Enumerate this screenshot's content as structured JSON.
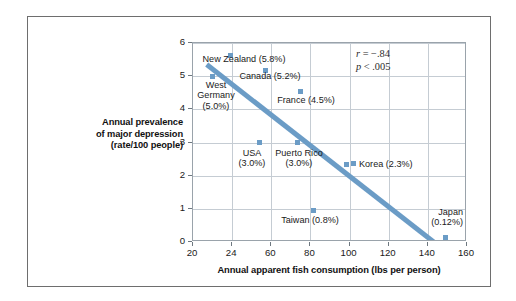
{
  "figure": {
    "border_color": "#6e6e6e",
    "background": "#ffffff"
  },
  "axes": {
    "x_title": "Annual apparent fish consumption (lbs per person)",
    "y_title_lines": [
      "Annual prevalence",
      "of major depression",
      "(rate/100 people)"
    ],
    "x_ticks": [
      "20",
      "24",
      "60",
      "80",
      "100",
      "120",
      "140",
      "160"
    ],
    "y_ticks": [
      "0",
      "1",
      "2",
      "3",
      "4",
      "5",
      "6"
    ]
  },
  "annotation": {
    "r_var": "r",
    "r_text": " = −.84",
    "p_var": "p",
    "p_text": " < .005"
  },
  "style": {
    "marker_color": "#6b9cc6",
    "trendline_color": "#6b9cc6",
    "gridline_color": "#c5ccd3",
    "plot_border_color": "#9aa3ab"
  },
  "chart_data": {
    "type": "scatter",
    "title": "",
    "xlabel": "Annual apparent fish consumption (lbs per person)",
    "ylabel": "Annual prevalence of major depression (rate/100 people)",
    "xlim": [
      20,
      160
    ],
    "ylim": [
      0,
      6
    ],
    "xticks": [
      20,
      24,
      60,
      80,
      100,
      120,
      140,
      160
    ],
    "yticks": [
      0,
      1,
      2,
      3,
      4,
      5,
      6
    ],
    "grid": true,
    "legend": "none",
    "correlation": -0.84,
    "p_value": "< .005",
    "points": [
      {
        "name": "New Zealand",
        "label": "New Zealand (5.8%)",
        "x": 40,
        "y": 5.8,
        "rate_percent": 5.8,
        "label_lines": [
          "New Zealand (5.8%)"
        ],
        "label_align": "center",
        "label_left": 191,
        "label_top": 53,
        "label_width": 104,
        "marker_left": 229,
        "marker_top": 54
      },
      {
        "name": "West Germany",
        "label": "West Germany (5.0%)",
        "x": 30,
        "y": 5.0,
        "rate_percent": 5.0,
        "label_lines": [
          "West",
          "Germany",
          "(5.0%)"
        ],
        "label_align": "center",
        "label_left": 187,
        "label_top": 79,
        "label_width": 56,
        "marker_left": 211,
        "marker_top": 75
      },
      {
        "name": "Canada",
        "label": "Canada (5.2%)",
        "x": 53,
        "y": 5.2,
        "rate_percent": 5.2,
        "label_lines": [
          "Canada (5.2%)"
        ],
        "label_align": "center",
        "label_left": 230,
        "label_top": 70,
        "label_width": 78,
        "marker_left": 264,
        "marker_top": 69
      },
      {
        "name": "France",
        "label": "France (4.5%)",
        "x": 65,
        "y": 4.5,
        "rate_percent": 4.5,
        "label_lines": [
          "France (4.5%)"
        ],
        "label_align": "center",
        "label_left": 266,
        "label_top": 94,
        "label_width": 78,
        "marker_left": 299,
        "marker_top": 90
      },
      {
        "name": "USA",
        "label": "USA (3.0%)",
        "x": 49,
        "y": 3.0,
        "rate_percent": 3.0,
        "label_lines": [
          "USA",
          "(3.0%)"
        ],
        "label_align": "center",
        "label_left": 230,
        "label_top": 147,
        "label_width": 42,
        "marker_left": 258,
        "marker_top": 141
      },
      {
        "name": "Puerto Rico",
        "label": "Puerto Rico (3.0%)",
        "x": 68,
        "y": 3.0,
        "rate_percent": 3.0,
        "label_lines": [
          "Puerto Rico",
          "(3.0%)"
        ],
        "label_align": "center",
        "label_left": 267,
        "label_top": 147,
        "label_width": 62,
        "marker_left": 296,
        "marker_top": 141
      },
      {
        "name": "Korea",
        "label": "Korea (2.3%)",
        "x": 107,
        "y": 2.3,
        "rate_percent": 2.3,
        "label_lines": [
          "Korea (2.3%)"
        ],
        "label_align": "left",
        "label_left": 350,
        "label_top": 158,
        "label_width": 90,
        "marker_left": 345,
        "marker_top": 163
      },
      {
        "name": "Taiwan",
        "label": "Taiwan (0.8%)",
        "x": 82,
        "y": 0.8,
        "rate_percent": 0.8,
        "label_lines": [
          "Taiwan (0.8%)"
        ],
        "label_align": "center",
        "label_left": 270,
        "label_top": 214,
        "label_width": 78,
        "marker_left": 312,
        "marker_top": 209
      },
      {
        "name": "Japan",
        "label": "Japan (0.12%)",
        "x": 147,
        "y": 0.12,
        "rate_percent": 0.12,
        "label_lines": [
          "Japan",
          "(0.12%)"
        ],
        "label_align": "right",
        "label_left": 404,
        "label_top": 206,
        "label_width": 58,
        "marker_left": 444,
        "marker_top": 236
      }
    ],
    "trendline": {
      "x1": 27,
      "y1": 5.35,
      "x2": 143,
      "y2": 0.0,
      "color": "#6b9cc6",
      "width_px": 5
    }
  }
}
